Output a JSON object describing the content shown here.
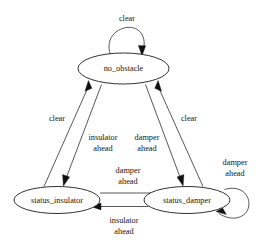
{
  "diagram": {
    "type": "state-transition-diagram",
    "background_color": "#ffffff",
    "stroke_color": "#1a1a1a",
    "text_color": "#141414",
    "states": [
      {
        "id": "no_obstacle",
        "label": "no_obstacle"
      },
      {
        "id": "status_insulator",
        "label": "status_insulator"
      },
      {
        "id": "status_damper",
        "label": "status_damper"
      }
    ],
    "transitions": [
      {
        "from": "no_obstacle",
        "to": "no_obstacle",
        "label": "clear"
      },
      {
        "from": "status_insulator",
        "to": "no_obstacle",
        "label": "clear"
      },
      {
        "from": "status_damper",
        "to": "no_obstacle",
        "label": "clear"
      },
      {
        "from": "no_obstacle",
        "to": "status_insulator",
        "label_line1": "insulator",
        "label_line2": "ahead"
      },
      {
        "from": "no_obstacle",
        "to": "status_damper",
        "label_line1": "damper",
        "label_line2": "ahead"
      },
      {
        "from": "status_insulator",
        "to": "status_damper",
        "label_line1": "damper",
        "label_line2": "ahead"
      },
      {
        "from": "status_damper",
        "to": "status_insulator",
        "label_line1": "insulator",
        "label_line2": "ahead"
      },
      {
        "from": "status_damper",
        "to": "status_damper",
        "label_line1": "damper",
        "label_line2": "ahead"
      }
    ],
    "labels": {
      "selfloop_top": "clear",
      "clear_left": "clear",
      "clear_right": "clear",
      "insulator_ahead_down_l1": "insulator",
      "insulator_ahead_down_l2": "ahead",
      "damper_ahead_down_l1": "damper",
      "damper_ahead_down_l2": "ahead",
      "damper_ahead_mid_l1": "damper",
      "damper_ahead_mid_l2": "ahead",
      "insulator_ahead_mid_l1": "insulator",
      "insulator_ahead_mid_l2": "ahead",
      "damper_ahead_selfloop_l1": "damper",
      "damper_ahead_selfloop_l2": "ahead"
    },
    "state_labels": {
      "no_obstacle": "no_obstacle",
      "status_insulator": "status_insulator",
      "status_damper": "status_damper"
    }
  }
}
